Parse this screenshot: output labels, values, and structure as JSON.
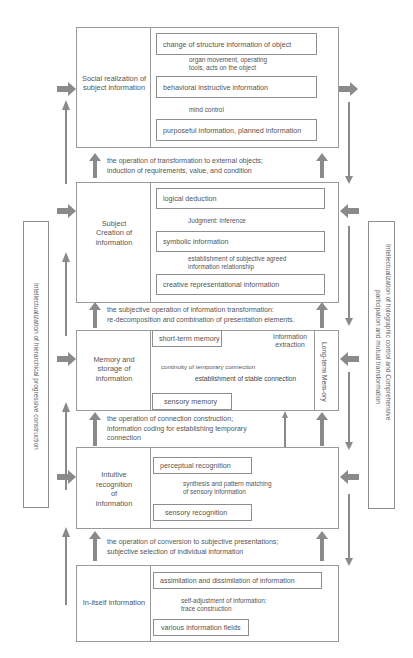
{
  "colors": {
    "arrow": "#8a8a8a",
    "border": "#9a9a9a",
    "text": "#555555"
  },
  "side_panels": {
    "left": "Intellectualization of hierarchical progressive construction",
    "right_line1": "Intellectualization of holographic control and Comprehensive",
    "right_line2": "participation and mutual transformation"
  },
  "levels": [
    {
      "title": "Social realization of subject information",
      "items": [
        "change of structure information of object",
        "behavioral instructive information",
        "purposeful information, planned information"
      ],
      "arrow_labels": [
        "organ movement, operating",
        "tools, acts on the object",
        "mind control"
      ]
    },
    {
      "title_line1": "Subject",
      "title_line2": "Creation of",
      "title_line3": "information",
      "items": [
        "logical deduction",
        "symbolic information",
        "creative representational information"
      ],
      "arrow_labels": [
        "Judgment: inference",
        "establishment of subjective agreed",
        "information relationship"
      ]
    },
    {
      "title_line1": "Memory and",
      "title_line2": "storage of",
      "title_line3": "information",
      "items": [
        "short-term memory",
        "sensory memory"
      ],
      "long_term": "Long-term Mem-ory",
      "info_extraction_1": "Information",
      "info_extraction_2": "extraction",
      "continuity": "continuity of temporary connection",
      "stable": "establishment of stable connection"
    },
    {
      "title_line1": "Intuitive",
      "title_line2": "recognition",
      "title_line3": "of",
      "title_line4": "information",
      "items": [
        "perceptual recognition",
        "sensory recognition"
      ],
      "arrow_labels": [
        "synthesis and pattern matching",
        "of sensory information"
      ]
    },
    {
      "title": "In-itself information",
      "items": [
        "assimilation and dissimilation of information",
        "various information fields"
      ],
      "arrow_labels": [
        "self-adjustment of information:",
        "trace construction"
      ]
    }
  ],
  "operations": [
    [
      "the operation of transformation to external objects;",
      "induction of requirements, value, and condition"
    ],
    [
      "the subjective operation of information transformation:",
      "re-decomposition and combination of presentation elements."
    ],
    [
      "the operation of connection construction;",
      "information coding for establishing temporary",
      "connection"
    ],
    [
      "the operation of conversion to subjective presentations;",
      "subjective selection of individual information"
    ]
  ]
}
